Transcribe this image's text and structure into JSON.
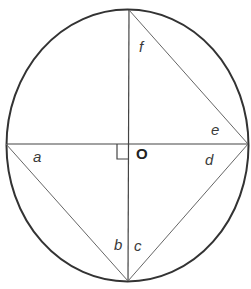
{
  "diagram": {
    "type": "circle-geometry",
    "colors": {
      "circle_stroke": "#333333",
      "line_stroke": "#444444",
      "chord_stroke": "#666666",
      "label": "#3a3a3a"
    },
    "center_label": "O",
    "angle_labels": {
      "a": "a",
      "b": "b",
      "c": "c",
      "d": "d",
      "e": "e",
      "f": "f"
    },
    "right_angle_marker": true
  }
}
